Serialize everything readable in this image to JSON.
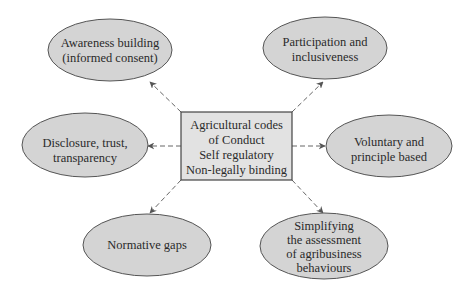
{
  "diagram": {
    "center": {
      "lines": [
        "Agricultural codes",
        "of Conduct",
        "Self regulatory",
        "Non-legally binding"
      ]
    },
    "nodes": [
      {
        "id": "awareness",
        "lines": [
          "Awareness building",
          "(informed consent)"
        ]
      },
      {
        "id": "participation",
        "lines": [
          "Participation and",
          "inclusiveness"
        ]
      },
      {
        "id": "disclosure",
        "lines": [
          "Disclosure, trust,",
          "transparency"
        ]
      },
      {
        "id": "voluntary",
        "lines": [
          "Voluntary and",
          "principle based"
        ]
      },
      {
        "id": "normative",
        "lines": [
          "Normative gaps"
        ]
      },
      {
        "id": "simplifying",
        "lines": [
          "Simplifying",
          "the assessment",
          "of agribusiness",
          "behaviours"
        ]
      }
    ],
    "colors": {
      "node_fill": "#d4d4d4",
      "box_fill": "#e2e2e2",
      "stroke": "#555555"
    }
  }
}
